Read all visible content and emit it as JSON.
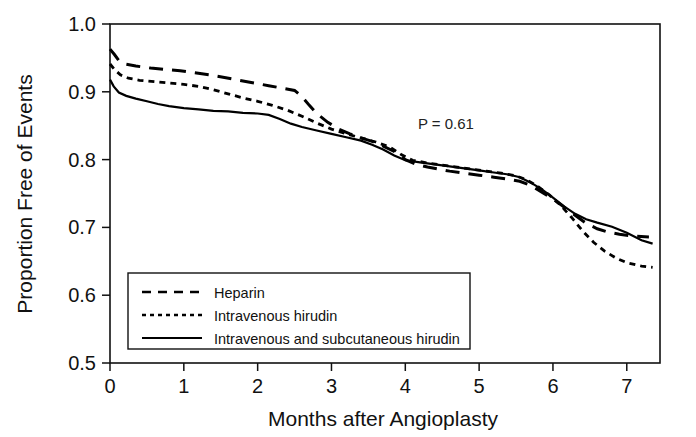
{
  "chart_data": {
    "type": "line",
    "title": "",
    "xlabel": "Months after Angioplasty",
    "ylabel": "Proportion Free of Events",
    "xlim": [
      0,
      7.45
    ],
    "ylim": [
      0.5,
      1.0
    ],
    "xticks": [
      0,
      1,
      2,
      3,
      4,
      5,
      6,
      7
    ],
    "xtick_labels": [
      "0",
      "1",
      "2",
      "3",
      "4",
      "5",
      "6",
      "7"
    ],
    "yticks": [
      0.5,
      0.6,
      0.7,
      0.8,
      0.9,
      1.0
    ],
    "ytick_labels": [
      "0.5",
      "0.6",
      "0.7",
      "0.8",
      "0.9",
      "1.0"
    ],
    "grid": false,
    "legend_position": "lower-left-inside",
    "annotations": [
      {
        "text": "P = 0.61",
        "x": 4.55,
        "y": 0.845
      }
    ],
    "series": [
      {
        "name": "Heparin",
        "style": "long-dash",
        "dasharray": "14,9",
        "width": 3.0,
        "points": [
          [
            0.0,
            0.963
          ],
          [
            0.06,
            0.955
          ],
          [
            0.12,
            0.946
          ],
          [
            0.2,
            0.941
          ],
          [
            0.35,
            0.938
          ],
          [
            0.55,
            0.935
          ],
          [
            0.75,
            0.933
          ],
          [
            0.95,
            0.931
          ],
          [
            1.15,
            0.928
          ],
          [
            1.35,
            0.925
          ],
          [
            1.55,
            0.921
          ],
          [
            1.75,
            0.917
          ],
          [
            1.95,
            0.913
          ],
          [
            2.15,
            0.909
          ],
          [
            2.35,
            0.905
          ],
          [
            2.5,
            0.902
          ],
          [
            2.6,
            0.893
          ],
          [
            2.7,
            0.88
          ],
          [
            2.8,
            0.868
          ],
          [
            2.95,
            0.855
          ],
          [
            3.1,
            0.845
          ],
          [
            3.25,
            0.838
          ],
          [
            3.4,
            0.832
          ],
          [
            3.55,
            0.827
          ],
          [
            3.7,
            0.82
          ],
          [
            3.85,
            0.812
          ],
          [
            4.0,
            0.8
          ],
          [
            4.15,
            0.793
          ],
          [
            4.3,
            0.789
          ],
          [
            4.45,
            0.786
          ],
          [
            4.6,
            0.783
          ],
          [
            4.8,
            0.78
          ],
          [
            5.0,
            0.777
          ],
          [
            5.2,
            0.774
          ],
          [
            5.4,
            0.771
          ],
          [
            5.55,
            0.768
          ],
          [
            5.7,
            0.762
          ],
          [
            5.85,
            0.752
          ],
          [
            6.0,
            0.742
          ],
          [
            6.15,
            0.73
          ],
          [
            6.3,
            0.718
          ],
          [
            6.45,
            0.706
          ],
          [
            6.6,
            0.698
          ],
          [
            6.75,
            0.693
          ],
          [
            6.9,
            0.69
          ],
          [
            7.1,
            0.687
          ],
          [
            7.3,
            0.686
          ]
        ]
      },
      {
        "name": "Intravenous hirudin",
        "style": "short-dash",
        "dasharray": "6,5",
        "width": 2.8,
        "points": [
          [
            0.0,
            0.941
          ],
          [
            0.06,
            0.933
          ],
          [
            0.14,
            0.925
          ],
          [
            0.25,
            0.92
          ],
          [
            0.4,
            0.917
          ],
          [
            0.6,
            0.915
          ],
          [
            0.8,
            0.913
          ],
          [
            1.0,
            0.911
          ],
          [
            1.2,
            0.908
          ],
          [
            1.4,
            0.903
          ],
          [
            1.6,
            0.897
          ],
          [
            1.8,
            0.891
          ],
          [
            2.0,
            0.886
          ],
          [
            2.2,
            0.88
          ],
          [
            2.4,
            0.873
          ],
          [
            2.6,
            0.864
          ],
          [
            2.8,
            0.854
          ],
          [
            3.0,
            0.845
          ],
          [
            3.2,
            0.838
          ],
          [
            3.4,
            0.832
          ],
          [
            3.6,
            0.826
          ],
          [
            3.8,
            0.818
          ],
          [
            3.95,
            0.807
          ],
          [
            4.1,
            0.799
          ],
          [
            4.3,
            0.795
          ],
          [
            4.5,
            0.792
          ],
          [
            4.7,
            0.789
          ],
          [
            4.9,
            0.786
          ],
          [
            5.1,
            0.783
          ],
          [
            5.3,
            0.78
          ],
          [
            5.5,
            0.776
          ],
          [
            5.65,
            0.77
          ],
          [
            5.8,
            0.76
          ],
          [
            5.95,
            0.748
          ],
          [
            6.1,
            0.733
          ],
          [
            6.25,
            0.715
          ],
          [
            6.4,
            0.695
          ],
          [
            6.55,
            0.678
          ],
          [
            6.7,
            0.665
          ],
          [
            6.85,
            0.655
          ],
          [
            7.0,
            0.648
          ],
          [
            7.2,
            0.643
          ],
          [
            7.35,
            0.641
          ]
        ]
      },
      {
        "name": "Intravenous and subcutaneous hirudin",
        "style": "solid",
        "dasharray": "",
        "width": 2.2,
        "points": [
          [
            0.0,
            0.918
          ],
          [
            0.05,
            0.908
          ],
          [
            0.12,
            0.899
          ],
          [
            0.22,
            0.894
          ],
          [
            0.35,
            0.89
          ],
          [
            0.5,
            0.886
          ],
          [
            0.65,
            0.882
          ],
          [
            0.8,
            0.879
          ],
          [
            1.0,
            0.876
          ],
          [
            1.2,
            0.874
          ],
          [
            1.4,
            0.872
          ],
          [
            1.6,
            0.871
          ],
          [
            1.8,
            0.869
          ],
          [
            2.0,
            0.868
          ],
          [
            2.15,
            0.866
          ],
          [
            2.3,
            0.86
          ],
          [
            2.45,
            0.853
          ],
          [
            2.6,
            0.848
          ],
          [
            2.8,
            0.843
          ],
          [
            3.0,
            0.838
          ],
          [
            3.2,
            0.833
          ],
          [
            3.4,
            0.828
          ],
          [
            3.55,
            0.822
          ],
          [
            3.7,
            0.815
          ],
          [
            3.85,
            0.806
          ],
          [
            4.0,
            0.799
          ],
          [
            4.2,
            0.796
          ],
          [
            4.4,
            0.793
          ],
          [
            4.6,
            0.79
          ],
          [
            4.8,
            0.787
          ],
          [
            5.0,
            0.784
          ],
          [
            5.2,
            0.781
          ],
          [
            5.4,
            0.778
          ],
          [
            5.55,
            0.774
          ],
          [
            5.7,
            0.766
          ],
          [
            5.85,
            0.756
          ],
          [
            6.0,
            0.744
          ],
          [
            6.15,
            0.731
          ],
          [
            6.3,
            0.72
          ],
          [
            6.45,
            0.712
          ],
          [
            6.6,
            0.707
          ],
          [
            6.8,
            0.701
          ],
          [
            7.0,
            0.692
          ],
          [
            7.2,
            0.681
          ],
          [
            7.35,
            0.676
          ]
        ]
      }
    ],
    "legend": [
      {
        "label": "Heparin",
        "style": "long-dash"
      },
      {
        "label": "Intravenous hirudin",
        "style": "short-dash"
      },
      {
        "label": "Intravenous and subcutaneous hirudin",
        "style": "solid"
      }
    ]
  }
}
